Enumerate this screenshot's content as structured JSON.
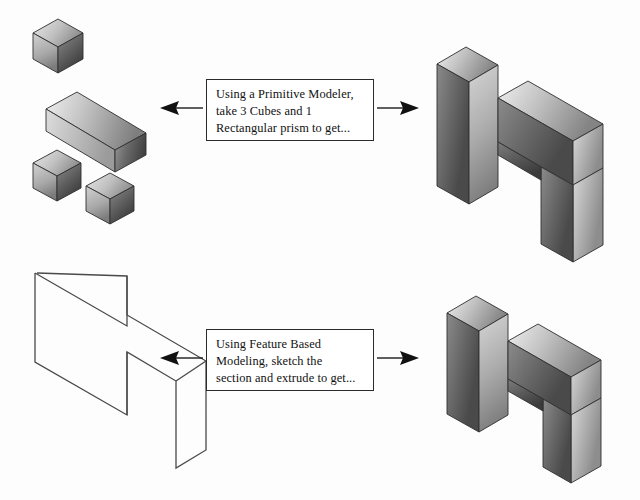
{
  "diagram": {
    "background_color": "#fdfdfd",
    "ink_color": "#2b2b2b"
  },
  "callouts": [
    {
      "id": "primitive-modeling",
      "line1": "Using a Primitive Modeler,",
      "line2": "take 3 Cubes and 1",
      "line3": "Rectangular prism to get..."
    },
    {
      "id": "feature-based-modeling",
      "line1": "Using Feature Based",
      "line2": "Modeling, sketch the",
      "line3": "section and extrude to get..."
    }
  ],
  "arrows": [
    {
      "id": "top-left-arrow",
      "direction": "left"
    },
    {
      "id": "top-right-arrow",
      "direction": "right"
    },
    {
      "id": "bottom-left-arrow",
      "direction": "left"
    },
    {
      "id": "bottom-right-arrow",
      "direction": "right"
    }
  ],
  "shapes": {
    "primitives": {
      "label": "3 cubes and 1 rectangular prism",
      "cubes": 3,
      "prisms": 1
    },
    "sketch_profile": {
      "label": "2D h-shaped section outline",
      "style": "wireframe"
    },
    "solid_top": {
      "label": "h-shaped solid assembled from primitives"
    },
    "solid_bottom": {
      "label": "h-shaped solid created by extruding the section"
    }
  },
  "colors": {
    "top_face_light": "#e2e2e2",
    "top_face_dark": "#9a9a9a",
    "left_face_light": "#c9c9c9",
    "left_face_dark": "#6f6f6f",
    "right_face_light": "#8f8f8f",
    "right_face_dark": "#3c3c3c",
    "outline": "#2b2b2b"
  }
}
